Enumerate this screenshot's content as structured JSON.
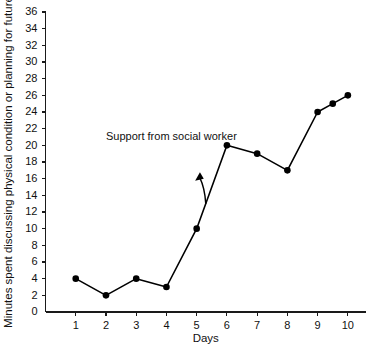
{
  "chart_data": {
    "type": "line",
    "title": "",
    "xlabel": "Days",
    "ylabel": "Minutes spent discussing physical condition or planning for future",
    "xlim": [
      0,
      10.6
    ],
    "ylim": [
      0,
      36
    ],
    "grid": false,
    "legend": null,
    "x": [
      1,
      2,
      3,
      4,
      5,
      6,
      7,
      8,
      9,
      9.5,
      10
    ],
    "values": [
      4,
      2,
      4,
      3,
      10,
      20,
      19,
      17,
      24,
      25,
      26
    ],
    "xticks": [
      1,
      2,
      3,
      4,
      5,
      6,
      7,
      8,
      9,
      10
    ],
    "xtick_labels": [
      "1",
      "2",
      "3",
      "4",
      "5",
      "6",
      "7",
      "8",
      "9",
      "10"
    ],
    "yticks": [
      0,
      2,
      4,
      6,
      8,
      10,
      12,
      14,
      16,
      18,
      20,
      22,
      24,
      26,
      28,
      30,
      32,
      34,
      36
    ],
    "ytick_labels": [
      "0",
      "2",
      "4",
      "6",
      "8",
      "10",
      "12",
      "14",
      "16",
      "18",
      "20",
      "22",
      "24",
      "26",
      "28",
      "30",
      "32",
      "34",
      "36"
    ],
    "annotations": [
      {
        "text": "Support from social worker",
        "x": 2.0,
        "y": 20.6,
        "arrow_to_x": 5.3,
        "arrow_to_y": 13.0
      }
    ],
    "series_color": "#000000",
    "axis_color": "#1a1a1a",
    "background_color": "#ffffff"
  }
}
